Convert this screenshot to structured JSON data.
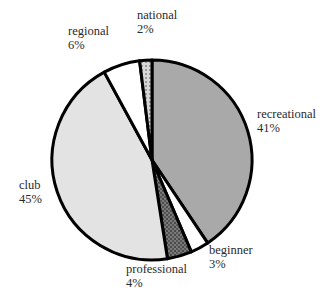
{
  "chart_data": {
    "type": "pie",
    "title": "",
    "start_angle_deg": 0,
    "direction": "clockwise",
    "slices": [
      {
        "label": "recreational",
        "value": 41,
        "pct_label": "41%",
        "color": "#a9a9a9",
        "pattern": "solid"
      },
      {
        "label": "beginner",
        "value": 3,
        "pct_label": "3%",
        "color": "#ffffff",
        "pattern": "solid"
      },
      {
        "label": "professional",
        "value": 4,
        "pct_label": "4%",
        "color": "#6e6e6e",
        "pattern": "dark-texture"
      },
      {
        "label": "club",
        "value": 45,
        "pct_label": "45%",
        "color": "#e3e3e3",
        "pattern": "solid"
      },
      {
        "label": "regional",
        "value": 6,
        "pct_label": "6%",
        "color": "#ffffff",
        "pattern": "solid"
      },
      {
        "label": "national",
        "value": 2,
        "pct_label": "2%",
        "color": "#c8c8c8",
        "pattern": "light-texture"
      }
    ],
    "legend": "none (labels placed beside slices)",
    "outline_color": "#000000"
  },
  "labels": {
    "recreational": {
      "name": "recreational",
      "pct": "41%"
    },
    "beginner": {
      "name": "beginner",
      "pct": "3%"
    },
    "professional": {
      "name": "professional",
      "pct": "4%"
    },
    "club": {
      "name": "club",
      "pct": "45%"
    },
    "regional": {
      "name": "regional",
      "pct": "6%"
    },
    "national": {
      "name": "national",
      "pct": "2%"
    }
  }
}
